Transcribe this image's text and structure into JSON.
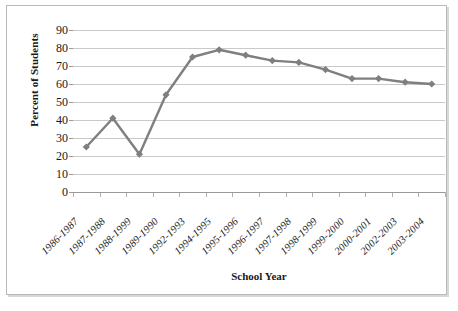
{
  "chart_data": {
    "type": "line",
    "title": "",
    "xlabel": "School Year",
    "ylabel": "Percent of Students",
    "categories": [
      "1986-1987",
      "1987-1988",
      "1988-1999",
      "1989-1990",
      "1992-1993",
      "1994-1995",
      "1995-1996",
      "1996-1997",
      "1997-1998",
      "1998-1999",
      "1999-2000",
      "2000-2001",
      "2002-2003",
      "2003-2004"
    ],
    "values": [
      25,
      41,
      21,
      54,
      75,
      79,
      76,
      73,
      72,
      68,
      63,
      63,
      61,
      60
    ],
    "ylim": [
      0,
      90
    ],
    "ytick_labels": [
      "90",
      "80",
      "70",
      "60",
      "50",
      "40",
      "30",
      "20",
      "10",
      "0"
    ],
    "ytick_values": [
      90,
      80,
      70,
      60,
      50,
      40,
      30,
      20,
      10,
      0
    ],
    "grid": "horizontal",
    "legend": "none",
    "series_color": "#7f7f7f",
    "marker": "diamond",
    "gridline_color": "#c9c9c9",
    "axis_color": "#9a9a9a",
    "border_color": "#b9b9b9",
    "background_color": "#ffffff"
  }
}
